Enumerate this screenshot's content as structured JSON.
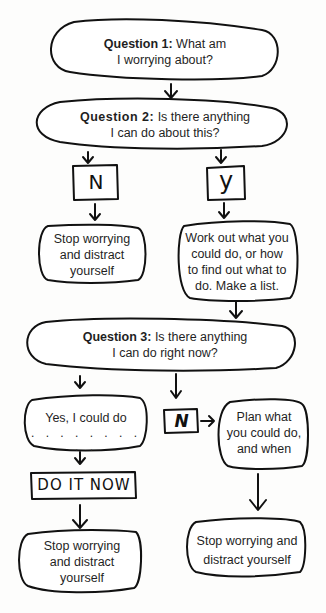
{
  "flowchart": {
    "q1": {
      "label": "Question 1:",
      "text_line1": " What am",
      "text_line2": "I worrying about?"
    },
    "q2": {
      "label": "Question 2:",
      "text_line1": " Is there anything",
      "text_line2": "I can do about this?"
    },
    "q2_no": {
      "letter": "N"
    },
    "q2_yes": {
      "letter": "y"
    },
    "q2_no_result": {
      "line1": "Stop worrying",
      "line2": "and distract",
      "line3": "yourself"
    },
    "q2_yes_result": {
      "line1": "Work out what you",
      "line2": "could do, or how",
      "line3": "to find out what to",
      "line4": "do. Make a list."
    },
    "q3": {
      "label": "Question 3:",
      "text_line1": " Is there anything",
      "text_line2": "I can do right now?"
    },
    "q3_yes": {
      "line1": "Yes, I could do",
      "blank": ". . . . . . . . . ."
    },
    "q3_no": {
      "letter": "N"
    },
    "q3_no_plan": {
      "line1": "Plan what",
      "line2": "you could do,",
      "line3": "and when"
    },
    "do_it_now": {
      "label": "DO IT NOW"
    },
    "q3_yes_result": {
      "line1": "Stop worrying",
      "line2": "and distract",
      "line3": "yourself"
    },
    "q3_no_result": {
      "line1": "Stop worrying and",
      "line2": "distract yourself"
    }
  }
}
